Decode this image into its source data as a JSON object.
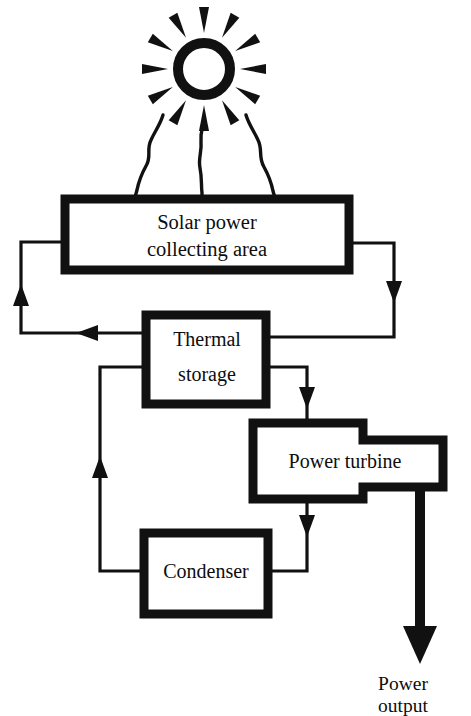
{
  "diagram": {
    "type": "flow-diagram",
    "background_color": "#ffffff",
    "stroke_color": "#111111",
    "text_color": "#0d0d0d",
    "nodes": [
      {
        "id": "solar-collector",
        "label_line1": "Solar power",
        "label_line2": "collecting area",
        "shape": "rectangle",
        "x": 65,
        "y": 199,
        "w": 284,
        "h": 71
      },
      {
        "id": "thermal-storage",
        "label_line1": "Thermal",
        "label_line2": "storage",
        "shape": "rectangle",
        "x": 146,
        "y": 315,
        "w": 120,
        "h": 89
      },
      {
        "id": "power-turbine",
        "label_line1": "Power turbine",
        "label_line2": "",
        "shape": "stepped-rectangle",
        "x": 253,
        "y": 423,
        "w": 190,
        "h": 76
      },
      {
        "id": "condenser",
        "label_line1": "Condenser",
        "label_line2": "",
        "shape": "rectangle",
        "x": 144,
        "y": 533,
        "w": 124,
        "h": 81
      }
    ],
    "sun": {
      "id": "sun",
      "center_x": 204,
      "center_y": 69,
      "ring_outer_radius": 31,
      "ring_inner_radius": 21,
      "ray_count": 12,
      "beam_count": 3
    },
    "output_arrow": {
      "id": "power-output",
      "label_line1": "Power",
      "label_line2": "output",
      "label_x": 403,
      "label_y_line1": 683,
      "label_y_line2": 708,
      "thick": true
    },
    "connections": [
      {
        "id": "solar-to-storage-right",
        "from": "solar-collector",
        "to": "thermal-storage",
        "arrow": "down-then-left"
      },
      {
        "id": "storage-to-solar-left",
        "from": "thermal-storage",
        "to": "solar-collector",
        "arrow": "left-then-up"
      },
      {
        "id": "storage-to-turbine",
        "from": "thermal-storage",
        "to": "power-turbine",
        "arrow": "right-then-down"
      },
      {
        "id": "turbine-to-condenser",
        "from": "power-turbine",
        "to": "condenser",
        "arrow": "down-then-left"
      },
      {
        "id": "condenser-to-storage",
        "from": "condenser",
        "to": "thermal-storage",
        "arrow": "left-then-up"
      },
      {
        "id": "turbine-to-output",
        "from": "power-turbine",
        "to": "power-output",
        "arrow": "down"
      }
    ]
  }
}
